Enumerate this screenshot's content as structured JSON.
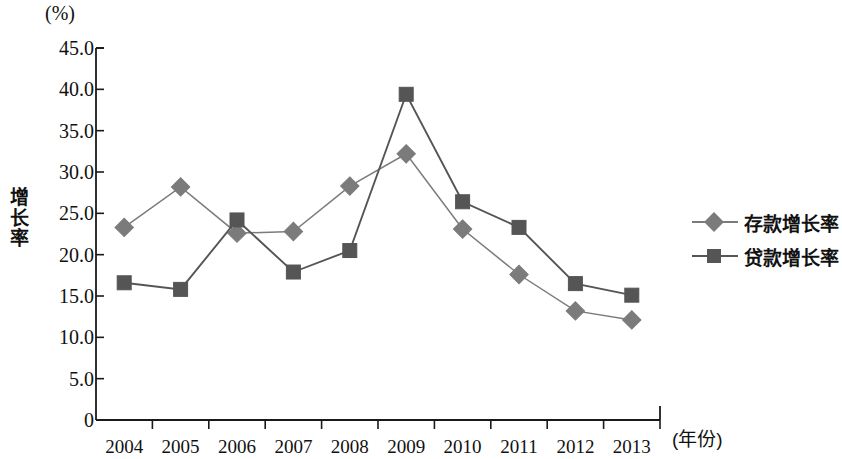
{
  "chart_data": {
    "type": "line",
    "title": "",
    "subtitle": "",
    "unit_label": "(%)",
    "ylabel": "增长率",
    "ylabel_chars": [
      "增",
      "长",
      "率"
    ],
    "xlabel": "(年份)",
    "categories": [
      "2004",
      "2005",
      "2006",
      "2007",
      "2008",
      "2009",
      "2010",
      "2011",
      "2012",
      "2013"
    ],
    "yticks": [
      "0",
      "5.0",
      "10.0",
      "15.0",
      "20.0",
      "25.0",
      "30.0",
      "35.0",
      "40.0",
      "45.0"
    ],
    "ytick_values": [
      0,
      5,
      10,
      15,
      20,
      25,
      30,
      35,
      40,
      45
    ],
    "ylim": [
      0,
      45
    ],
    "grid": false,
    "legend_position": "right",
    "series": [
      {
        "name": "存款增长率",
        "marker": "diamond",
        "color": "#7b7b7b",
        "values": [
          23.3,
          28.2,
          22.6,
          22.8,
          28.3,
          32.2,
          23.1,
          17.6,
          13.2,
          12.1
        ]
      },
      {
        "name": "贷款增长率",
        "marker": "square",
        "color": "#555555",
        "values": [
          16.6,
          15.8,
          24.2,
          17.9,
          20.5,
          39.4,
          26.4,
          23.3,
          16.5,
          15.1
        ]
      }
    ]
  },
  "colors": {
    "axis": "#1a1a1a",
    "series_deposit": "#7b7b7b",
    "series_loan": "#555555",
    "background": "#ffffff"
  }
}
